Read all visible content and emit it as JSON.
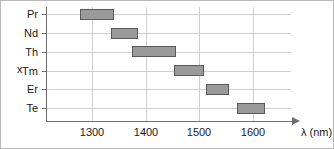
{
  "chart_data": {
    "type": "bar",
    "orientation": "horizontal-range",
    "title": "",
    "xlabel": "λ (nm)",
    "ylabel": "x",
    "xlim": [
      1240,
      1650
    ],
    "xticks": [
      1300,
      1400,
      1500,
      1600
    ],
    "xticklabels": [
      "1300",
      "1400",
      "1500",
      "1600"
    ],
    "categories": [
      "Pr",
      "Nd",
      "Th",
      "Tm",
      "Er",
      "Te"
    ],
    "grid": true,
    "legend": false,
    "bar_color": "#9a9a9a",
    "bar_edge_color": "#595959",
    "grid_color": "#cfcfcf",
    "axis_color": "#6e6e6e",
    "ranges": [
      {
        "category": "Pr",
        "start": 1278,
        "end": 1341
      },
      {
        "category": "Nd",
        "start": 1335,
        "end": 1386
      },
      {
        "category": "Th",
        "start": 1374,
        "end": 1456
      },
      {
        "category": "Tm",
        "start": 1453,
        "end": 1509
      },
      {
        "category": "Er",
        "start": 1512,
        "end": 1555
      },
      {
        "category": "Te",
        "start": 1570,
        "end": 1622
      }
    ]
  },
  "axes": {
    "y_title": "x",
    "x_title": "λ (nm)"
  }
}
